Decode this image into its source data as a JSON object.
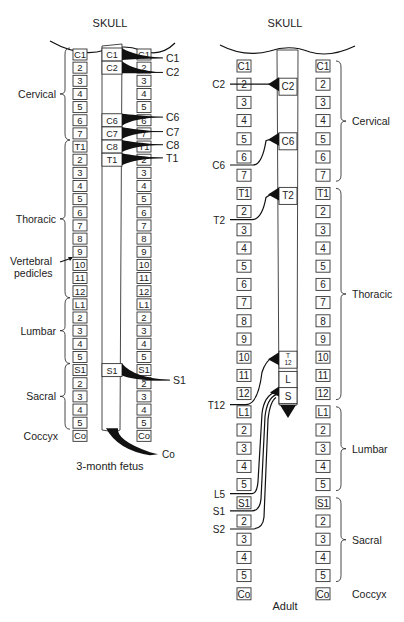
{
  "fetus": {
    "skull_label": "SKULL",
    "caption": "3-month fetus",
    "vertebrae": [
      "C1",
      "2",
      "3",
      "4",
      "5",
      "6",
      "7",
      "T1",
      "2",
      "3",
      "4",
      "5",
      "6",
      "7",
      "8",
      "9",
      "10",
      "11",
      "12",
      "L1",
      "2",
      "3",
      "4",
      "5",
      "S1",
      "2",
      "3",
      "4",
      "5",
      "Co"
    ],
    "regions": [
      {
        "label": "Cervical",
        "from": 0,
        "to": 6
      },
      {
        "label": "Thoracic",
        "from": 7,
        "to": 18
      },
      {
        "label": "Lumbar",
        "from": 19,
        "to": 23
      },
      {
        "label": "Sacral",
        "from": 24,
        "to": 28
      },
      {
        "label": "Coccyx",
        "from": 29,
        "to": 29
      }
    ],
    "annotation": "Vertebral pedicles",
    "cord_segments": [
      {
        "label": "C1",
        "row": 0
      },
      {
        "label": "C2",
        "row": 1
      },
      {
        "label": "C6",
        "row": 5
      },
      {
        "label": "C7",
        "row": 6
      },
      {
        "label": "C8",
        "row": 7
      },
      {
        "label": "T1",
        "row": 8
      },
      {
        "label": "S1",
        "row": 24
      }
    ],
    "nerves": [
      {
        "label": "C1",
        "from_row": 0,
        "to_row": 0.3
      },
      {
        "label": "C2",
        "from_row": 1,
        "to_row": 1.4
      },
      {
        "label": "C6",
        "from_row": 5,
        "to_row": 4.8
      },
      {
        "label": "C7",
        "from_row": 6,
        "to_row": 5.9
      },
      {
        "label": "C8",
        "from_row": 7,
        "to_row": 6.9
      },
      {
        "label": "T1",
        "from_row": 8,
        "to_row": 7.9
      },
      {
        "label": "S1",
        "from_row": 24,
        "to_row": 24.8
      },
      {
        "label": "Co",
        "from_row": 29.7,
        "to_row": 30.2
      }
    ]
  },
  "adult": {
    "skull_label": "SKULL",
    "caption": "Adult",
    "vertebrae": [
      "C1",
      "2",
      "3",
      "4",
      "5",
      "6",
      "7",
      "T1",
      "2",
      "3",
      "4",
      "5",
      "6",
      "7",
      "8",
      "9",
      "10",
      "11",
      "12",
      "L1",
      "2",
      "3",
      "4",
      "5",
      "S1",
      "2",
      "3",
      "4",
      "5",
      "Co"
    ],
    "regions": [
      {
        "label": "Cervical",
        "from": 0,
        "to": 6
      },
      {
        "label": "Thoracic",
        "from": 7,
        "to": 18
      },
      {
        "label": "Lumbar",
        "from": 19,
        "to": 23
      },
      {
        "label": "Sacral",
        "from": 24,
        "to": 28
      },
      {
        "label": "Coccyx",
        "from": 29,
        "to": 29
      }
    ],
    "cord_segments": [
      {
        "label": "C2",
        "row": 1
      },
      {
        "label": "C6",
        "row": 4
      },
      {
        "label": "T2",
        "row": 7
      },
      {
        "label": "T\n12",
        "row": 16
      },
      {
        "label": "L",
        "row": 17
      },
      {
        "label": "S",
        "row": 18
      }
    ],
    "nerves": [
      {
        "label": "C2",
        "row": 1
      },
      {
        "label": "C6",
        "row": 5
      },
      {
        "label": "T2",
        "row": 8.5
      },
      {
        "label": "T12",
        "row": 18.6
      },
      {
        "label": "L5",
        "row": 24.5
      },
      {
        "label": "S1",
        "row": 25.5
      },
      {
        "label": "S2",
        "row": 26.5
      }
    ]
  }
}
